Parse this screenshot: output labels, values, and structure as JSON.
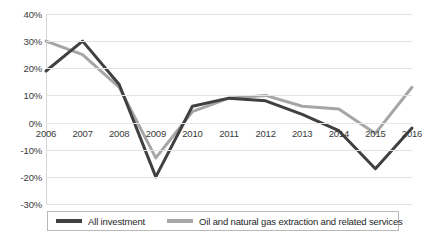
{
  "chart_data": {
    "type": "line",
    "title": "",
    "xlabel": "",
    "ylabel": "",
    "categories": [
      "2006",
      "2007",
      "2008",
      "2009",
      "2010",
      "2011",
      "2012",
      "2013",
      "2014",
      "2015",
      "2016"
    ],
    "ylim": [
      -30,
      40
    ],
    "ytick_values": [
      40,
      30,
      20,
      10,
      0,
      -10,
      -20,
      -30
    ],
    "ytick_labels": [
      "40%",
      "30%",
      "20%",
      "10%",
      "0%",
      "-10%",
      "-20%",
      "-30%"
    ],
    "grid": true,
    "legend_position": "bottom",
    "series": [
      {
        "name": "All investment",
        "color": "#404040",
        "values": [
          19,
          30,
          14,
          -20,
          6,
          9,
          8,
          3,
          -3,
          -17,
          -2
        ]
      },
      {
        "name": "Oil and natural gas extraction and related services",
        "color": "#a6a6a6",
        "values": [
          30,
          25,
          13,
          -13,
          4,
          9,
          10,
          6,
          5,
          -4,
          13
        ]
      }
    ]
  }
}
